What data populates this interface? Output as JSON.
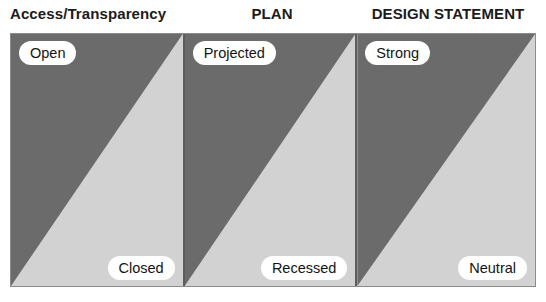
{
  "diagram": {
    "title_row": {
      "headers": [
        "Access/Transparency",
        "PLAN",
        "DESIGN STATEMENT"
      ]
    },
    "colors": {
      "dark_fill": "#6b6b6b",
      "light_fill": "#d2d2d2",
      "frame_border": "#8c8c8c",
      "divider": "#5d5d5d",
      "pill_background": "#ffffff",
      "text": "#141414"
    },
    "panels": [
      {
        "header": "Access/Transparency",
        "top_label": "Open",
        "bottom_label": "Closed"
      },
      {
        "header": "PLAN",
        "top_label": "Projected",
        "bottom_label": "Recessed"
      },
      {
        "header": "DESIGN STATEMENT",
        "top_label": "Strong",
        "bottom_label": "Neutral"
      }
    ]
  },
  "chart_data": {
    "type": "diagram",
    "title": "",
    "categories": [
      "Access/Transparency",
      "PLAN",
      "DESIGN STATEMENT"
    ],
    "series": [
      {
        "name": "Access/Transparency",
        "pole_high": "Open",
        "pole_low": "Closed"
      },
      {
        "name": "PLAN",
        "pole_high": "Projected",
        "pole_low": "Recessed"
      },
      {
        "name": "DESIGN STATEMENT",
        "pole_high": "Strong",
        "pole_low": "Neutral"
      }
    ],
    "legend": [],
    "grid": false
  }
}
